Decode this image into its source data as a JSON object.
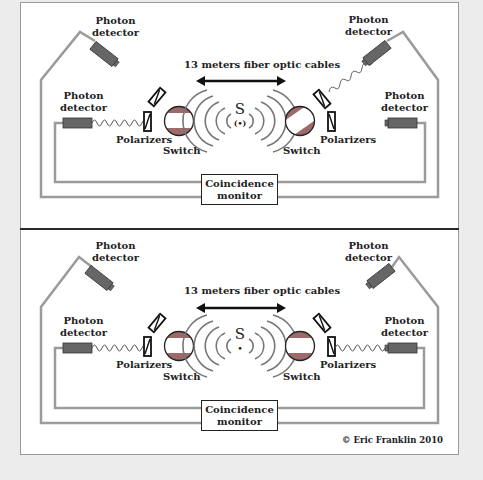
{
  "figure": {
    "credit": "© Eric Franklin 2010",
    "colors": {
      "background": "#ececec",
      "panel": "#ffffff",
      "cable": "#9b9b9b",
      "detector": "#666666",
      "switch_band": "#9c6a6a",
      "ink": "#222222"
    }
  },
  "panels": [
    {
      "id": "top",
      "cable_label": "13 meters fiber optic cables",
      "source_label": "S",
      "source_glyph": "(•)",
      "left": {
        "upper_detector": "Photon\ndetector",
        "lower_detector": "Photon\ndetector",
        "polarizers": "Polarizers",
        "switch": "Switch",
        "active_path": "lower"
      },
      "right": {
        "upper_detector": "Photon\ndetector",
        "lower_detector": "Photon\ndetector",
        "polarizers": "Polarizers",
        "switch": "Switch",
        "active_path": "upper"
      },
      "monitor": "Coincidence\nmonitor"
    },
    {
      "id": "bottom",
      "cable_label": "13 meters fiber optic cables",
      "source_label": "S",
      "source_glyph": "•",
      "left": {
        "upper_detector": "Photon\ndetector",
        "lower_detector": "Photon\ndetector",
        "polarizers": "Polarizers",
        "switch": "Switch",
        "active_path": "lower"
      },
      "right": {
        "upper_detector": "Photon\ndetector",
        "lower_detector": "Photon\ndetector",
        "polarizers": "Polarizers",
        "switch": "Switch",
        "active_path": "lower"
      },
      "monitor": "Coincidence\nmonitor"
    }
  ]
}
